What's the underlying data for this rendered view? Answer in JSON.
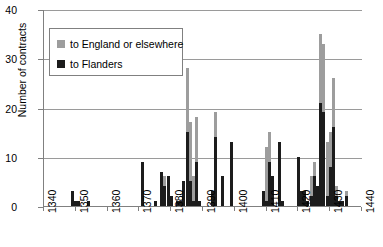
{
  "chart_data": {
    "type": "bar",
    "title": "",
    "subtitle": "",
    "xlabel": "",
    "ylabel": "Number of contracts",
    "xlim": [
      1340,
      1440
    ],
    "ylim": [
      0,
      40
    ],
    "ytick_labels": [
      "0",
      "10",
      "20",
      "30",
      "40"
    ],
    "ytick_values": [
      0,
      10,
      20,
      30,
      40
    ],
    "xtick_labels": [
      "1340",
      "1350",
      "1360",
      "1370",
      "1380",
      "1390",
      "1400",
      "1410",
      "1420",
      "1430",
      "1440"
    ],
    "xtick_values": [
      1340,
      1350,
      1360,
      1370,
      1380,
      1390,
      1400,
      1410,
      1420,
      1430,
      1440
    ],
    "grid": "horizontal",
    "stacked": true,
    "legend_position": "upper-left",
    "legend": [
      {
        "name": "to England or elsewhere",
        "color": "#9d9d9d"
      },
      {
        "name": "to Flanders",
        "color": "#1c1c1c"
      }
    ],
    "series": [
      {
        "name": "to Flanders",
        "color": "#1c1c1c",
        "values": [
          0,
          0,
          0,
          0,
          0,
          0,
          0,
          0,
          0,
          3,
          1,
          1,
          0,
          0,
          1,
          0,
          0,
          0,
          0,
          0,
          0,
          0,
          0,
          0,
          0,
          0,
          0,
          0,
          0,
          0,
          0,
          9,
          0,
          0,
          0,
          1,
          0,
          7,
          4,
          6,
          2,
          0,
          1,
          1,
          5,
          15,
          5,
          1,
          9,
          1,
          0,
          0,
          0,
          3,
          14,
          0,
          6,
          0,
          0,
          13,
          0,
          0,
          0,
          0,
          0,
          0,
          0,
          0,
          0,
          3,
          1,
          9,
          6,
          0,
          13,
          1,
          0,
          0,
          0,
          0,
          10,
          3,
          3,
          1,
          2,
          6,
          4,
          21,
          19,
          2,
          8,
          16,
          2,
          1,
          1,
          2,
          0,
          0,
          0,
          0,
          0
        ]
      },
      {
        "name": "to England or elsewhere",
        "color": "#9d9d9d",
        "values": [
          0,
          0,
          0,
          0,
          0,
          0,
          0,
          0,
          0,
          0,
          0,
          0,
          0,
          0,
          0,
          0,
          0,
          0,
          0,
          0,
          0,
          0,
          0,
          0,
          0,
          0,
          0,
          0,
          0,
          0,
          0,
          0,
          0,
          0,
          0,
          0,
          0,
          0,
          2,
          0,
          0,
          0,
          0,
          0,
          0,
          13,
          12,
          5,
          9,
          0,
          0,
          0,
          0,
          0,
          5,
          0,
          0,
          0,
          0,
          0,
          0,
          0,
          0,
          0,
          0,
          0,
          0,
          0,
          0,
          0,
          11,
          6,
          0,
          0,
          0,
          0,
          0,
          0,
          0,
          0,
          0,
          0,
          0,
          0,
          4,
          3,
          0,
          14,
          14,
          11,
          7,
          10,
          2,
          0,
          0,
          1,
          0,
          0,
          0,
          0,
          0
        ]
      }
    ],
    "x": [
      1340,
      1341,
      1342,
      1343,
      1344,
      1345,
      1346,
      1347,
      1348,
      1349,
      1350,
      1351,
      1352,
      1353,
      1354,
      1355,
      1356,
      1357,
      1358,
      1359,
      1360,
      1361,
      1362,
      1363,
      1364,
      1365,
      1366,
      1367,
      1368,
      1369,
      1370,
      1371,
      1372,
      1373,
      1374,
      1375,
      1376,
      1377,
      1378,
      1379,
      1380,
      1381,
      1382,
      1383,
      1384,
      1385,
      1386,
      1387,
      1388,
      1389,
      1390,
      1391,
      1392,
      1393,
      1394,
      1395,
      1396,
      1397,
      1398,
      1399,
      1400,
      1401,
      1402,
      1403,
      1404,
      1405,
      1406,
      1407,
      1408,
      1409,
      1410,
      1411,
      1412,
      1413,
      1414,
      1415,
      1416,
      1417,
      1418,
      1419,
      1420,
      1421,
      1422,
      1423,
      1424,
      1425,
      1426,
      1427,
      1428,
      1429,
      1430,
      1431,
      1432,
      1433,
      1434,
      1435,
      1436,
      1437,
      1438,
      1439,
      1440
    ]
  }
}
